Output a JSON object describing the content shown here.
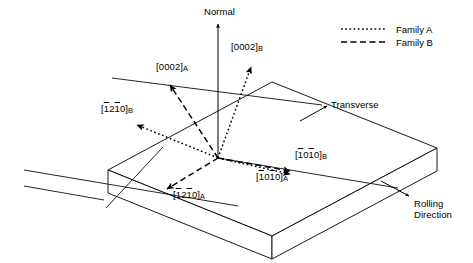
{
  "figure": {
    "background_color": "#ffffff",
    "line_color": "#000000",
    "width": 473,
    "height": 263
  },
  "axes": {
    "normal": {
      "label": "Normal",
      "x": 204,
      "y": 8
    },
    "transverse": {
      "label": "Transverse",
      "x": 331,
      "y": 100
    },
    "rolling_direction": {
      "line1": "Rolling",
      "line2": "Direction",
      "x": 414,
      "y": 199
    }
  },
  "legend": {
    "position": "top-right",
    "items": [
      {
        "label": "Family A",
        "style": "dotted",
        "dash": "1.6 2.4"
      },
      {
        "label": "Family B",
        "style": "dashed",
        "dash": "6 3.5"
      }
    ]
  },
  "vectors": [
    {
      "id": "0002-A",
      "name": "[0002]_A",
      "family": "A",
      "style": "dashed",
      "label": {
        "open": "[",
        "digits": "0002",
        "close": "]",
        "sub": "A"
      },
      "label_x": 156,
      "label_y": 62,
      "from": {
        "x": 218,
        "y": 158
      },
      "to": {
        "x": 168,
        "y": 82
      }
    },
    {
      "id": "0002-B",
      "name": "[0002]_B",
      "family": "B",
      "style": "dotted",
      "label": {
        "open": "[",
        "digits": "0002",
        "close": "]",
        "sub": "B"
      },
      "label_x": 231,
      "label_y": 42,
      "from": {
        "x": 218,
        "y": 158
      },
      "to": {
        "x": 252,
        "y": 64
      }
    },
    {
      "id": "1210-B",
      "name": "[-12-10]_B",
      "family": "B",
      "style": "dotted",
      "label": {
        "open": "[",
        "d1": "1",
        "d2": "2",
        "d3": "1",
        "d4": "0",
        "close": "]",
        "sub": "B"
      },
      "label_x": 101,
      "label_y": 104,
      "from": {
        "x": 218,
        "y": 158
      },
      "to": {
        "x": 133,
        "y": 124
      }
    },
    {
      "id": "1210-A",
      "name": "[-12-10]_A",
      "family": "A",
      "style": "dashed",
      "label": {
        "open": "[",
        "d1": "1",
        "d2": "2",
        "d3": "1",
        "d4": "0",
        "close": "]",
        "sub": "A"
      },
      "label_x": 173,
      "label_y": 190,
      "from": {
        "x": 218,
        "y": 158
      },
      "to": {
        "x": 163,
        "y": 191
      }
    },
    {
      "id": "1010-B",
      "name": "[-10-10]_B",
      "family": "B",
      "style": "dashed",
      "label": {
        "open": "[",
        "d1": "1",
        "d2": "0",
        "d3": "1",
        "d4": "0",
        "close": "]",
        "sub": "B"
      },
      "label_x": 295,
      "label_y": 150,
      "from": {
        "x": 218,
        "y": 158
      },
      "to": {
        "x": 293,
        "y": 172
      }
    },
    {
      "id": "1010-A",
      "name": "[-10-10]_A",
      "family": "A",
      "style": "dotted",
      "label": {
        "open": "[",
        "d1": "1",
        "d2": "0",
        "d3": "1",
        "d4": "0",
        "close": "]",
        "sub": "A"
      },
      "label_x": 256,
      "label_y": 172,
      "from": {
        "x": 218,
        "y": 158
      },
      "to": {
        "x": 293,
        "y": 172
      }
    }
  ],
  "slab": {
    "description": "rolled plate drawn in oblique projection",
    "top_face": [
      {
        "x": 108,
        "y": 170
      },
      {
        "x": 272,
        "y": 82
      },
      {
        "x": 437,
        "y": 148
      },
      {
        "x": 272,
        "y": 236
      }
    ],
    "thickness": 24
  },
  "reference_lines": {
    "transverse_guide": {
      "x1": 112,
      "y1": 78,
      "x2": 325,
      "y2": 105
    },
    "rolling_guide": {
      "x1": 24,
      "y1": 170,
      "x2": 240,
      "y2": 207
    }
  }
}
